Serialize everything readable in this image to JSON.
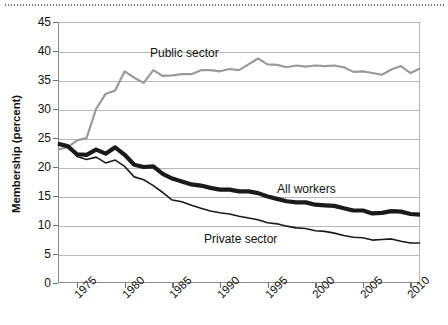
{
  "chart_data": {
    "type": "line",
    "title": "",
    "xlabel": "",
    "ylabel": "Membership (percent)",
    "ylim": [
      0,
      45
    ],
    "xlim": [
      1973,
      2011
    ],
    "ytick_labels": [
      "0",
      "5",
      "10",
      "15",
      "20",
      "25",
      "30",
      "35",
      "40",
      "45"
    ],
    "ytick_values": [
      0,
      5,
      10,
      15,
      20,
      25,
      30,
      35,
      40,
      45
    ],
    "xtick_labels": [
      "1975",
      "1980",
      "1985",
      "1990",
      "1995",
      "2000",
      "2005",
      "2010"
    ],
    "xtick_values": [
      1975,
      1980,
      1985,
      1990,
      1995,
      2000,
      2005,
      2010
    ],
    "grid": true,
    "legend_position": "inline-annotations",
    "annotations": [
      {
        "name": "public-sector-label",
        "text": "Public sector"
      },
      {
        "name": "all-workers-label",
        "text": "All workers"
      },
      {
        "name": "private-sector-label",
        "text": "Private sector"
      }
    ],
    "x": [
      1973,
      1974,
      1975,
      1976,
      1977,
      1978,
      1979,
      1980,
      1981,
      1982,
      1983,
      1984,
      1985,
      1986,
      1987,
      1988,
      1989,
      1990,
      1991,
      1992,
      1993,
      1994,
      1995,
      1996,
      1997,
      1998,
      1999,
      2000,
      2001,
      2002,
      2003,
      2004,
      2005,
      2006,
      2007,
      2008,
      2009,
      2010,
      2011
    ],
    "series": [
      {
        "name": "Public sector",
        "color": "#9a9a9a",
        "width": 2.2,
        "values": [
          23.0,
          23.4,
          24.6,
          25.0,
          30.0,
          32.6,
          33.2,
          36.5,
          35.4,
          34.5,
          36.7,
          35.7,
          35.8,
          36.0,
          36.0,
          36.7,
          36.7,
          36.5,
          36.9,
          36.7,
          37.7,
          38.7,
          37.7,
          37.6,
          37.2,
          37.5,
          37.3,
          37.5,
          37.4,
          37.5,
          37.2,
          36.4,
          36.5,
          36.2,
          35.9,
          36.8,
          37.4,
          36.2,
          37.0
        ]
      },
      {
        "name": "All workers",
        "color": "#1a1a1a",
        "width": 4.2,
        "values": [
          24.0,
          23.6,
          22.2,
          22.1,
          23.0,
          22.3,
          23.4,
          22.1,
          20.4,
          20.0,
          20.1,
          18.8,
          18.0,
          17.5,
          17.0,
          16.8,
          16.4,
          16.1,
          16.1,
          15.8,
          15.8,
          15.5,
          14.9,
          14.5,
          14.1,
          13.9,
          13.9,
          13.5,
          13.4,
          13.3,
          12.9,
          12.5,
          12.5,
          12.0,
          12.1,
          12.4,
          12.3,
          11.9,
          11.8
        ]
      },
      {
        "name": "Private sector",
        "color": "#1a1a1a",
        "width": 1.6,
        "values": [
          24.2,
          23.6,
          21.8,
          21.3,
          21.7,
          20.7,
          21.2,
          20.1,
          18.3,
          17.8,
          16.8,
          15.6,
          14.3,
          14.0,
          13.4,
          12.9,
          12.4,
          12.1,
          11.9,
          11.5,
          11.2,
          10.9,
          10.4,
          10.2,
          9.8,
          9.5,
          9.4,
          9.0,
          8.9,
          8.6,
          8.2,
          7.9,
          7.8,
          7.4,
          7.5,
          7.6,
          7.2,
          6.9,
          6.9
        ]
      }
    ]
  },
  "axis": {
    "y_title": "Membership (percent)"
  }
}
